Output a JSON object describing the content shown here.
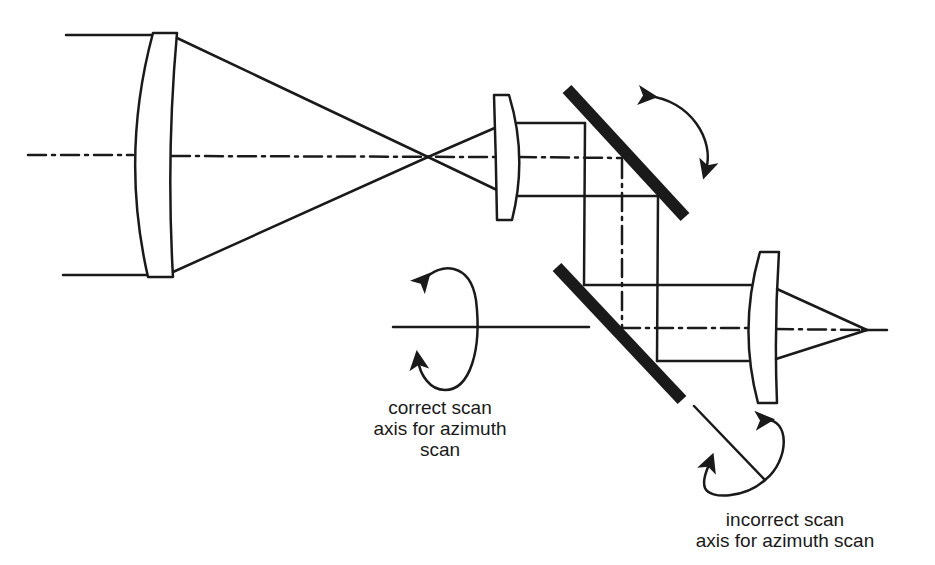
{
  "diagram": {
    "type": "optical-layout",
    "ink_color": "#1a1a1a",
    "background": "#ffffff",
    "elements": [
      {
        "id": "objective-lens",
        "kind": "lens"
      },
      {
        "id": "input-rays",
        "kind": "ray-bundle"
      },
      {
        "id": "optical-axis",
        "kind": "dash-dot-line"
      },
      {
        "id": "collimating-lens",
        "kind": "lens"
      },
      {
        "id": "scan-mirror-1",
        "kind": "fold-mirror",
        "rotation": "tilt arrows"
      },
      {
        "id": "scan-mirror-2",
        "kind": "fold-mirror"
      },
      {
        "id": "focusing-lens",
        "kind": "lens"
      },
      {
        "id": "correct-scan-axis",
        "kind": "rotation-axis"
      },
      {
        "id": "incorrect-scan-axis",
        "kind": "rotation-axis"
      }
    ]
  },
  "labels": {
    "correct": [
      "correct scan",
      "axis for azimuth",
      "scan"
    ],
    "incorrect": [
      "incorrect scan",
      "axis for azimuth scan"
    ]
  }
}
